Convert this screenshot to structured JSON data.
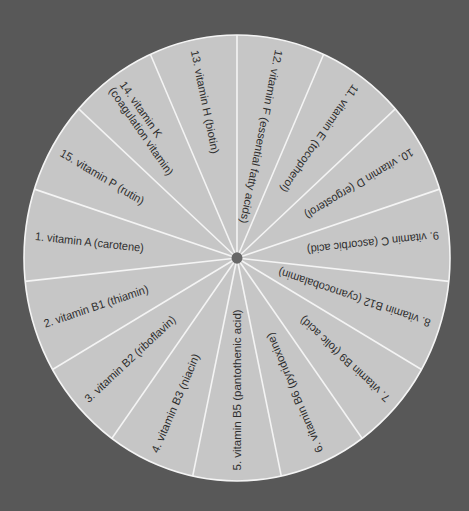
{
  "colors": {
    "background": "#585858",
    "wheel_fill": "#c6c6c6",
    "divider": "#f4f4f4",
    "hub": "#676767",
    "text": "#2e2e2e"
  },
  "wheel": {
    "center": [
      237,
      258
    ],
    "rx": 213,
    "ry": 223,
    "segment_count": 15,
    "segment_angle_deg": 24,
    "hub_radius": 5.5
  },
  "segments": [
    {
      "number": "1.",
      "lines": [
        "1.  vitamin A (carotene)"
      ],
      "angle": 186
    },
    {
      "number": "2.",
      "lines": [
        "2.  vitamin B1 (thiamin)"
      ],
      "angle": 162
    },
    {
      "number": "3.",
      "lines": [
        "3.  vitamin B2 (riboflavin)"
      ],
      "angle": 138
    },
    {
      "number": "4.",
      "lines": [
        "4.  vitamin B3 (niacin)"
      ],
      "angle": 114
    },
    {
      "number": "5.",
      "lines": [
        "5.  vitamin B5 (pantothenic acid)"
      ],
      "angle": 90
    },
    {
      "number": "6.",
      "lines": [
        "6.  vitamin B6 (pyridoxine)"
      ],
      "angle": 66
    },
    {
      "number": "7.",
      "lines": [
        "7.  vitamin B9 (folic acid)"
      ],
      "angle": 42
    },
    {
      "number": "8.",
      "lines": [
        "8.  vitamin B12 (cyanocobalamin)"
      ],
      "angle": 18
    },
    {
      "number": "9.",
      "lines": [
        "9.  vitamin C (ascorbic acid)"
      ],
      "angle": -6
    },
    {
      "number": "10.",
      "lines": [
        "10.  vitamin D (ergosterol)"
      ],
      "angle": -30
    },
    {
      "number": "11.",
      "lines": [
        "11.  vitamin E (tocopherol)"
      ],
      "angle": -54
    },
    {
      "number": "12.",
      "lines": [
        "12.  vitamin F (essential fatty acids)"
      ],
      "angle": -78
    },
    {
      "number": "13.",
      "lines": [
        "13.  vitamin H (biotin)"
      ],
      "angle": -102
    },
    {
      "number": "14.",
      "lines": [
        "14.  vitamin K",
        "(coagulation vitamin)"
      ],
      "angle": -126
    },
    {
      "number": "15.",
      "lines": [
        "15.  vitamin P (rutin)"
      ],
      "angle": -150
    }
  ]
}
